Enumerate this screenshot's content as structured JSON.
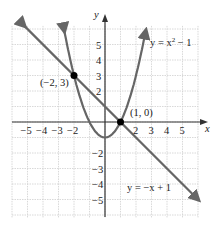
{
  "chart_data": {
    "type": "line",
    "title": "",
    "xlabel": "x",
    "ylabel": "y",
    "xlim": [
      -6,
      6
    ],
    "ylim": [
      -6,
      6
    ],
    "grid": true,
    "x_ticks": [
      "-5",
      "-4",
      "-3",
      "-2",
      "2",
      "3",
      "4",
      "5"
    ],
    "y_ticks": [
      "5",
      "4",
      "3",
      "2",
      "-2",
      "-3",
      "-4",
      "-5"
    ],
    "series": [
      {
        "name": "y = x² − 1",
        "equation": "y = x^2 - 1",
        "color": "#666666"
      },
      {
        "name": "y = −x + 1",
        "equation": "y = -x + 1",
        "color": "#666666"
      }
    ],
    "points": [
      {
        "x": -2,
        "y": 3,
        "label": "(−2, 3)"
      },
      {
        "x": 1,
        "y": 0,
        "label": "(1, 0)"
      }
    ],
    "annotations": {
      "parabola_label": "y = x² − 1",
      "line_label": "y = −x + 1"
    }
  },
  "labels": {
    "x_axis": "x",
    "y_axis": "y",
    "parabola_y": "y = x",
    "parabola_exp": "2",
    "parabola_rest": " − 1",
    "line_label": "y = −x + 1",
    "point1": "(−2, 3)",
    "point2": "(1, 0)"
  }
}
